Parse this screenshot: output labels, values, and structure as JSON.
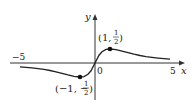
{
  "diagram": {
    "function": "f(x) = x / (1 + x^2)",
    "axes": {
      "x_label": "x",
      "y_label": "y",
      "origin_label": "0",
      "x_ticks": [
        {
          "value": -5,
          "label": "−5"
        },
        {
          "value": 5,
          "label": "5"
        }
      ]
    },
    "points": [
      {
        "x": 1,
        "y": 0.5,
        "label_pre": "(1, ",
        "num": "1",
        "den": "2",
        "label_post": ")"
      },
      {
        "x": -1,
        "y": -0.5,
        "label_pre": "(−1, −",
        "num": "1",
        "den": "2",
        "label_post": ")"
      }
    ],
    "colors": {
      "curve": "#222222",
      "axis": "#333333",
      "point": "#111111"
    }
  }
}
